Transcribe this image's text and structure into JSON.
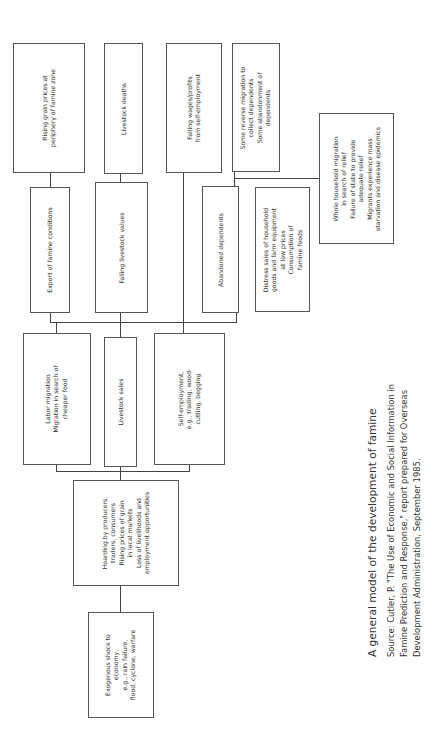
{
  "figure_label": "Figure 1-3",
  "caption": {
    "title": "A general model of the development of famine",
    "source_lines": [
      "Source: Cutler, P. \"The Use of Economic and Social Information in",
      "Famine Prediction and Response,\" report prepared for Overseas",
      "Development Administration, September 1985."
    ]
  },
  "nodes": {
    "shock": [
      "Exogenous shock to",
      "economy,",
      "e.g., rain failure,",
      "flood, cyclone, warfare"
    ],
    "hoarding": [
      "Hoarding by producers,",
      "traders, consumers",
      "Rising prices of grain",
      "in local markets",
      "Loss of livelihoods and",
      "employment opportunities"
    ],
    "labor_migration": [
      "Labor migration",
      "Migration in search of",
      "cheaper food"
    ],
    "livestock_sales": [
      "Livestock sales"
    ],
    "self_employment": [
      "Self-employment,",
      "e.g., trading, wood-",
      "cutting, begging"
    ],
    "export_famine": [
      "Export of famine conditions"
    ],
    "falling_livestock_values": [
      "Falling livestock values"
    ],
    "abandoned_dependents": [
      "Abandoned dependents"
    ],
    "distress_sales": [
      "Distress sales of household",
      "goods and farm equipment",
      "at low prices",
      "Consumption of",
      "famine foods"
    ],
    "rising_grain_prices": [
      "Rising grain prices at",
      "periphery of famine zone"
    ],
    "livestock_deaths": [
      "Livestock deaths"
    ],
    "falling_wages": [
      "Falling wages/profits",
      "from self-employment"
    ],
    "reverse_migration": [
      "Some reverse migration to",
      "collect dependents",
      "Some abandonment of",
      "dependents"
    ],
    "whole_household": [
      "Whole household migration",
      "in search of relief",
      "Failure of state to provide",
      "adequate relief",
      "Migrants experience mass",
      "starvation and disease epidemics"
    ]
  }
}
